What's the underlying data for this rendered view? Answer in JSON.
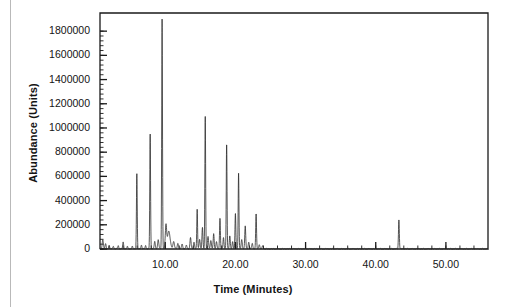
{
  "figure": {
    "kind": "chromatogram",
    "background_color": "#ffffff",
    "trace_color": "#2b2b2b",
    "axis_color": "#1a1a1a"
  },
  "axes": {
    "x_title": "Time (Minutes)",
    "y_title": "Abundance (Units)",
    "x_tick_labels": [
      "10.00",
      "20.00",
      "30.00",
      "40.00",
      "50.00"
    ],
    "y_tick_labels": [
      "0",
      "200000",
      "400000",
      "600000",
      "800000",
      "1000000",
      "1200000",
      "1400000",
      "1600000",
      "1800000"
    ]
  },
  "chart_data": {
    "type": "line",
    "title": "",
    "subtitle": "",
    "xlabel": "Time (Minutes)",
    "ylabel": "Abundance (Units)",
    "xlim": [
      0.7,
      56.0
    ],
    "ylim": [
      0,
      1950000
    ],
    "x_ticks": [
      10,
      20,
      30,
      40,
      50
    ],
    "x_tick_labels": [
      "10.00",
      "20.00",
      "30.00",
      "40.00",
      "50.00"
    ],
    "x_minor_tick_step": 2,
    "y_ticks": [
      0,
      200000,
      400000,
      600000,
      800000,
      1000000,
      1200000,
      1400000,
      1600000,
      1800000
    ],
    "y_tick_labels": [
      "0",
      "200000",
      "400000",
      "600000",
      "800000",
      "1000000",
      "1200000",
      "1400000",
      "1600000",
      "1800000"
    ],
    "y_minor_tick_step": 40000,
    "grid": false,
    "legend": null,
    "legend_position": "none",
    "annotations": [],
    "series": [
      {
        "name": "Total Ion Chromatogram",
        "color": "#2b2b2b",
        "baseline": 0,
        "peaks": [
          {
            "time": 1.1,
            "abundance": 75000,
            "width": 0.2
          },
          {
            "time": 1.5,
            "abundance": 40000,
            "width": 0.18
          },
          {
            "time": 2.0,
            "abundance": 28000,
            "width": 0.16
          },
          {
            "time": 2.6,
            "abundance": 22000,
            "width": 0.16
          },
          {
            "time": 3.3,
            "abundance": 26000,
            "width": 0.16
          },
          {
            "time": 4.0,
            "abundance": 55000,
            "width": 0.16
          },
          {
            "time": 4.6,
            "abundance": 20000,
            "width": 0.14
          },
          {
            "time": 5.3,
            "abundance": 20000,
            "width": 0.14
          },
          {
            "time": 5.95,
            "abundance": 620000,
            "width": 0.13
          },
          {
            "time": 6.6,
            "abundance": 30000,
            "width": 0.16
          },
          {
            "time": 7.2,
            "abundance": 28000,
            "width": 0.16
          },
          {
            "time": 7.85,
            "abundance": 950000,
            "width": 0.13
          },
          {
            "time": 8.5,
            "abundance": 60000,
            "width": 0.18
          },
          {
            "time": 9.0,
            "abundance": 75000,
            "width": 0.2
          },
          {
            "time": 9.55,
            "abundance": 1900000,
            "width": 0.13
          },
          {
            "time": 10.1,
            "abundance": 190000,
            "width": 0.22
          },
          {
            "time": 10.5,
            "abundance": 145000,
            "width": 0.45
          },
          {
            "time": 11.2,
            "abundance": 60000,
            "width": 0.25
          },
          {
            "time": 11.8,
            "abundance": 45000,
            "width": 0.2
          },
          {
            "time": 12.4,
            "abundance": 38000,
            "width": 0.2
          },
          {
            "time": 13.0,
            "abundance": 30000,
            "width": 0.18
          },
          {
            "time": 13.6,
            "abundance": 95000,
            "width": 0.18
          },
          {
            "time": 14.1,
            "abundance": 55000,
            "width": 0.18
          },
          {
            "time": 14.55,
            "abundance": 330000,
            "width": 0.13
          },
          {
            "time": 14.9,
            "abundance": 80000,
            "width": 0.18
          },
          {
            "time": 15.3,
            "abundance": 175000,
            "width": 0.16
          },
          {
            "time": 15.7,
            "abundance": 1095000,
            "width": 0.13
          },
          {
            "time": 16.1,
            "abundance": 100000,
            "width": 0.18
          },
          {
            "time": 16.5,
            "abundance": 70000,
            "width": 0.18
          },
          {
            "time": 16.9,
            "abundance": 125000,
            "width": 0.16
          },
          {
            "time": 17.3,
            "abundance": 60000,
            "width": 0.18
          },
          {
            "time": 17.8,
            "abundance": 255000,
            "width": 0.14
          },
          {
            "time": 18.3,
            "abundance": 90000,
            "width": 0.16
          },
          {
            "time": 18.75,
            "abundance": 870000,
            "width": 0.13
          },
          {
            "time": 19.2,
            "abundance": 105000,
            "width": 0.16
          },
          {
            "time": 19.6,
            "abundance": 60000,
            "width": 0.16
          },
          {
            "time": 20.0,
            "abundance": 290000,
            "width": 0.14
          },
          {
            "time": 20.45,
            "abundance": 625000,
            "width": 0.13
          },
          {
            "time": 20.9,
            "abundance": 75000,
            "width": 0.18
          },
          {
            "time": 21.4,
            "abundance": 190000,
            "width": 0.16
          },
          {
            "time": 21.9,
            "abundance": 55000,
            "width": 0.18
          },
          {
            "time": 22.4,
            "abundance": 45000,
            "width": 0.18
          },
          {
            "time": 22.95,
            "abundance": 290000,
            "width": 0.14
          },
          {
            "time": 23.4,
            "abundance": 35000,
            "width": 0.18
          },
          {
            "time": 23.9,
            "abundance": 25000,
            "width": 0.18
          },
          {
            "time": 43.3,
            "abundance": 240000,
            "width": 0.14
          }
        ]
      }
    ]
  }
}
